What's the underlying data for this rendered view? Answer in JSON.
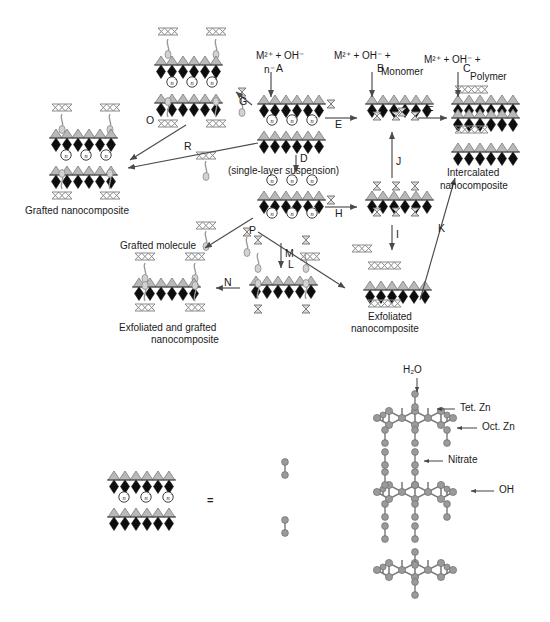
{
  "figure": {
    "title_top": "Layered double hydroxide nanocomposite formation pathways",
    "reagents": {
      "a_line1": "M²⁺ + OH⁻",
      "a_line2": "n⁻",
      "b_line1": "M²⁺ + OH⁻ +",
      "b_monomer": "Monomer",
      "c_line1": "M²⁺ + OH⁻ +",
      "c_polymer": "Polymer"
    },
    "steps": {
      "A": "A",
      "B": "B",
      "C": "C",
      "D": "D",
      "E": "E",
      "F": "F",
      "G": "G",
      "H": "H",
      "I": "I",
      "J": "J",
      "K": "K",
      "L": "L",
      "M": "M",
      "N": "N",
      "O": "O",
      "P": "P",
      "R": "R"
    },
    "labels": {
      "grafted_nanocomposite": "Grafted nanocomposite",
      "single_layer_suspension": "(single-layer suspension)",
      "intercalated_line1": "Intercalated",
      "intercalated_line2": "nanocomposite",
      "exfoliated_line1": "Exfoliated",
      "exfoliated_line2": "nanocomposite",
      "grafted_molecule": "Grafted molecule",
      "exfoliated_grafted_line1": "Exfoliated and grafted",
      "exfoliated_grafted_line2": "nanocomposite",
      "charge_symbol": "n⁻"
    },
    "bottom": {
      "water": "H₂O",
      "tet_zn": "Tet. Zn",
      "oct_zn": "Oct. Zn",
      "nitrate": "Nitrate",
      "hydroxide": "OH",
      "equals": "="
    },
    "colors": {
      "black_polyhedra": "#101010",
      "gray_polyhedra": "#b3b3b3",
      "chain_gray": "#a0a0a0",
      "atom_gray": "#8c8c8c",
      "text": "#1a1a1a",
      "arrow": "#4a4a4a"
    }
  }
}
